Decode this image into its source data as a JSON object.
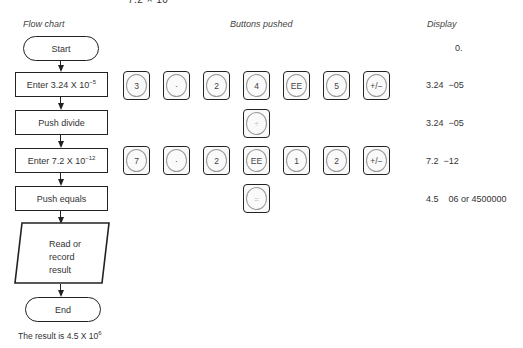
{
  "top_fragment": "7.2 × 10",
  "headers": {
    "flow_chart": "Flow chart",
    "buttons_pushed": "Buttons pushed",
    "display": "Display"
  },
  "flowchart": {
    "start": "Start",
    "step1": {
      "text": "Enter 3.24 X 10",
      "exp": "−5"
    },
    "step2": "Push divide",
    "step3": {
      "text": "Enter 7.2 X 10",
      "exp": "−12"
    },
    "step4": "Push equals",
    "read": [
      "Read or",
      "record",
      "result"
    ],
    "end": "End"
  },
  "buttons": {
    "row1": [
      "3",
      "·",
      "2",
      "4",
      "EE",
      "5",
      "+/−"
    ],
    "row2": [
      "÷"
    ],
    "row3": [
      "7",
      "·",
      "2",
      "EE",
      "1",
      "2",
      "+/−"
    ],
    "row4": [
      "="
    ]
  },
  "display": {
    "d0": "0.",
    "d1": "3.24  −05",
    "d2": "3.24  −05",
    "d3": "7.2  −12",
    "d4": "4.5    06 or 4500000"
  },
  "result": {
    "text": "The result is 4.5 X 10",
    "exp": "6"
  }
}
